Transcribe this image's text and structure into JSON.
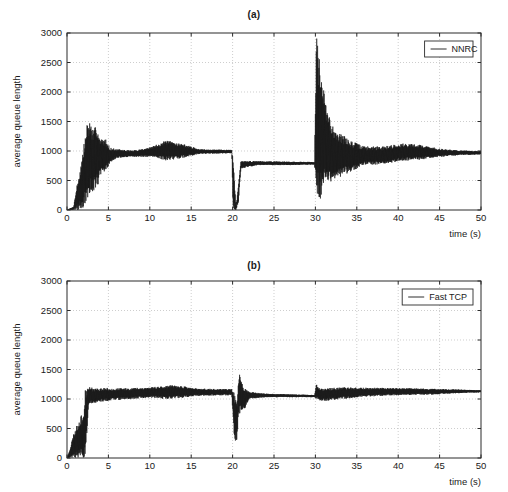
{
  "figure": {
    "background": "#ffffff",
    "trace_color": "#161616",
    "grid_color": "#b9b9b9",
    "axis_color": "#2b2b2b"
  },
  "chart_data": [
    {
      "type": "line",
      "title": "(a)",
      "xlabel": "time (s)",
      "ylabel": "average queue length",
      "xlim": [
        0,
        50
      ],
      "ylim": [
        0,
        3000
      ],
      "xticks": [
        0,
        5,
        10,
        15,
        20,
        25,
        30,
        35,
        40,
        45,
        50
      ],
      "yticks": [
        0,
        500,
        1000,
        1500,
        2000,
        2500,
        3000
      ],
      "grid": true,
      "legend": {
        "entries": [
          "NNRC"
        ],
        "position": "top-right"
      },
      "series": [
        {
          "name": "NNRC",
          "color": "#161616",
          "description": "Average queue length for NNRC: noisy ramp-up with large transients to ~1550 near t=2.5-3.7, settles to oscillation about 1000 from t=5, swell to ~1180 near t=12, collapse to 0 at t=20 then recovery to a steady ~800 band, large spike above 3000 at t=30 followed by heavily damped oscillations converging back to ~1000 by t=50.",
          "envelope": [
            {
              "t": 0.0,
              "min": 0,
              "max": 0
            },
            {
              "t": 0.8,
              "min": 0,
              "max": 60
            },
            {
              "t": 1.2,
              "min": 0,
              "max": 420
            },
            {
              "t": 1.6,
              "min": 0,
              "max": 700
            },
            {
              "t": 2.0,
              "min": 40,
              "max": 1080
            },
            {
              "t": 2.5,
              "min": 120,
              "max": 1550
            },
            {
              "t": 2.9,
              "min": 300,
              "max": 1480
            },
            {
              "t": 3.2,
              "min": 330,
              "max": 1330
            },
            {
              "t": 3.6,
              "min": 350,
              "max": 1490
            },
            {
              "t": 4.0,
              "min": 560,
              "max": 1200
            },
            {
              "t": 4.6,
              "min": 640,
              "max": 1220
            },
            {
              "t": 5.2,
              "min": 800,
              "max": 1060
            },
            {
              "t": 6.0,
              "min": 880,
              "max": 1030
            },
            {
              "t": 8.0,
              "min": 900,
              "max": 1010
            },
            {
              "t": 10.0,
              "min": 900,
              "max": 1060
            },
            {
              "t": 12.0,
              "min": 840,
              "max": 1180
            },
            {
              "t": 14.0,
              "min": 880,
              "max": 1120
            },
            {
              "t": 16.0,
              "min": 950,
              "max": 1030
            },
            {
              "t": 19.9,
              "min": 960,
              "max": 1020
            },
            {
              "t": 20.05,
              "min": 0,
              "max": 980
            },
            {
              "t": 20.4,
              "min": 0,
              "max": 60
            },
            {
              "t": 20.7,
              "min": 120,
              "max": 400
            },
            {
              "t": 21.0,
              "min": 700,
              "max": 830
            },
            {
              "t": 23.0,
              "min": 760,
              "max": 830
            },
            {
              "t": 27.0,
              "min": 760,
              "max": 820
            },
            {
              "t": 29.9,
              "min": 770,
              "max": 815
            },
            {
              "t": 30.1,
              "min": 0,
              "max": 3000
            },
            {
              "t": 30.5,
              "min": 60,
              "max": 2560
            },
            {
              "t": 30.9,
              "min": 420,
              "max": 2120
            },
            {
              "t": 31.4,
              "min": 480,
              "max": 1700
            },
            {
              "t": 32.0,
              "min": 480,
              "max": 1460
            },
            {
              "t": 33.0,
              "min": 560,
              "max": 1300
            },
            {
              "t": 34.5,
              "min": 660,
              "max": 1160
            },
            {
              "t": 36.0,
              "min": 760,
              "max": 1080
            },
            {
              "t": 38.0,
              "min": 760,
              "max": 1080
            },
            {
              "t": 40.5,
              "min": 830,
              "max": 1130
            },
            {
              "t": 42.5,
              "min": 850,
              "max": 1110
            },
            {
              "t": 45.0,
              "min": 900,
              "max": 1040
            },
            {
              "t": 47.5,
              "min": 930,
              "max": 1010
            },
            {
              "t": 50.0,
              "min": 940,
              "max": 1000
            }
          ]
        }
      ]
    },
    {
      "type": "line",
      "title": "(b)",
      "xlabel": "time (s)",
      "ylabel": "average queue length",
      "xlim": [
        0,
        50
      ],
      "ylim": [
        0,
        3000
      ],
      "xticks": [
        0,
        5,
        10,
        15,
        20,
        25,
        30,
        35,
        40,
        45,
        50
      ],
      "yticks": [
        0,
        500,
        1000,
        1500,
        2000,
        2500,
        3000
      ],
      "grid": true,
      "legend": {
        "entries": [
          "Fast TCP"
        ],
        "position": "top-right"
      },
      "series": [
        {
          "name": "Fast TCP",
          "color": "#161616",
          "description": "Average queue length for Fast TCP: dense low-level chatter between 0 and ~750 until t~2.2, then jumps to a tight band about 1100 with persistent small oscillations; a sharp dip to ~280 and spike to ~1460 at t=20 followed by damped ringing down to a flat ~1060 plateau, small spike to ~1250 at t=30 then oscillations settling at ~1120 through t=50.",
          "envelope": [
            {
              "t": 0.0,
              "min": 0,
              "max": 0
            },
            {
              "t": 0.4,
              "min": 0,
              "max": 180
            },
            {
              "t": 0.8,
              "min": 0,
              "max": 420
            },
            {
              "t": 1.2,
              "min": 0,
              "max": 560
            },
            {
              "t": 1.6,
              "min": 0,
              "max": 700
            },
            {
              "t": 2.0,
              "min": 0,
              "max": 760
            },
            {
              "t": 2.25,
              "min": 60,
              "max": 1220
            },
            {
              "t": 2.6,
              "min": 900,
              "max": 1230
            },
            {
              "t": 3.2,
              "min": 930,
              "max": 1180
            },
            {
              "t": 4.5,
              "min": 960,
              "max": 1190
            },
            {
              "t": 6.0,
              "min": 980,
              "max": 1180
            },
            {
              "t": 8.0,
              "min": 1000,
              "max": 1190
            },
            {
              "t": 10.0,
              "min": 1020,
              "max": 1200
            },
            {
              "t": 12.0,
              "min": 1000,
              "max": 1230
            },
            {
              "t": 13.5,
              "min": 1010,
              "max": 1230
            },
            {
              "t": 15.5,
              "min": 1050,
              "max": 1180
            },
            {
              "t": 18.0,
              "min": 1060,
              "max": 1170
            },
            {
              "t": 19.9,
              "min": 1060,
              "max": 1170
            },
            {
              "t": 20.2,
              "min": 280,
              "max": 1120
            },
            {
              "t": 20.5,
              "min": 280,
              "max": 900
            },
            {
              "t": 20.75,
              "min": 700,
              "max": 1460
            },
            {
              "t": 21.1,
              "min": 800,
              "max": 1300
            },
            {
              "t": 21.5,
              "min": 840,
              "max": 1180
            },
            {
              "t": 22.0,
              "min": 1000,
              "max": 1120
            },
            {
              "t": 24.0,
              "min": 1030,
              "max": 1090
            },
            {
              "t": 27.0,
              "min": 1030,
              "max": 1080
            },
            {
              "t": 29.9,
              "min": 1030,
              "max": 1070
            },
            {
              "t": 30.1,
              "min": 1000,
              "max": 1250
            },
            {
              "t": 30.6,
              "min": 960,
              "max": 1180
            },
            {
              "t": 32.0,
              "min": 980,
              "max": 1190
            },
            {
              "t": 34.0,
              "min": 1010,
              "max": 1200
            },
            {
              "t": 36.5,
              "min": 1040,
              "max": 1190
            },
            {
              "t": 39.0,
              "min": 1060,
              "max": 1190
            },
            {
              "t": 42.0,
              "min": 1070,
              "max": 1180
            },
            {
              "t": 45.0,
              "min": 1080,
              "max": 1170
            },
            {
              "t": 47.5,
              "min": 1100,
              "max": 1160
            },
            {
              "t": 50.0,
              "min": 1110,
              "max": 1150
            }
          ]
        }
      ]
    }
  ]
}
